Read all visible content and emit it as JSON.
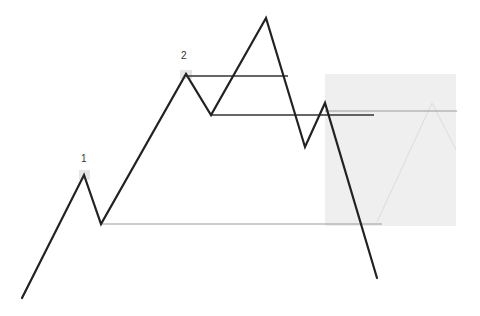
{
  "diagram": {
    "type": "price-pattern",
    "labels": [
      {
        "text": "1",
        "x": 84,
        "y": 164
      },
      {
        "text": "2",
        "x": 186,
        "y": 61
      }
    ],
    "colors": {
      "price_line": "#222222",
      "level_line_dark": "#333333",
      "level_line_light": "#999999",
      "shaded_box": "#efefef",
      "faint_projection": "#dcdcdc",
      "highlight": "#e4e4e4"
    },
    "price_path": [
      [
        22,
        298
      ],
      [
        84,
        175
      ],
      [
        101,
        224
      ],
      [
        186,
        74
      ],
      [
        211,
        115
      ],
      [
        266,
        18
      ],
      [
        305,
        147
      ],
      [
        325,
        103
      ],
      [
        377,
        278
      ]
    ],
    "levels": [
      {
        "x1": 101,
        "x2": 382,
        "y": 224,
        "tone": "light"
      },
      {
        "x1": 186,
        "x2": 288,
        "y": 76,
        "tone": "dark"
      },
      {
        "x1": 211,
        "x2": 374,
        "y": 115,
        "tone": "dark"
      },
      {
        "x1": 325,
        "x2": 457,
        "y": 111,
        "tone": "light"
      }
    ],
    "shaded_box": {
      "x": 325,
      "y": 74,
      "width": 131,
      "height": 152
    },
    "faint_projection": [
      [
        377,
        222
      ],
      [
        432,
        103
      ],
      [
        456,
        150
      ]
    ],
    "highlights": [
      {
        "x": 79,
        "y": 170,
        "width": 11,
        "height": 10
      },
      {
        "x": 180,
        "y": 70,
        "width": 12,
        "height": 9
      }
    ]
  }
}
